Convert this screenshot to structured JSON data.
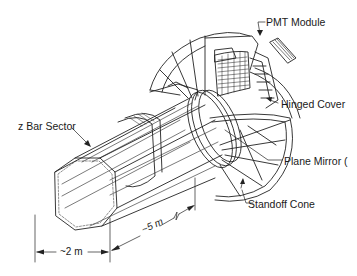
{
  "diagram": {
    "labels": {
      "pmt_module": "PMT Module",
      "hinged_cover": "Hinged Cover",
      "z_bar_sector": "z Bar Sector",
      "plane_mirror": "Plane Mirror (",
      "standoff_cone": "Standoff Cone"
    },
    "dimensions": {
      "diameter": "~2 m",
      "length": "~5 m"
    },
    "colors": {
      "line": "#222222",
      "background": "#ffffff"
    }
  }
}
